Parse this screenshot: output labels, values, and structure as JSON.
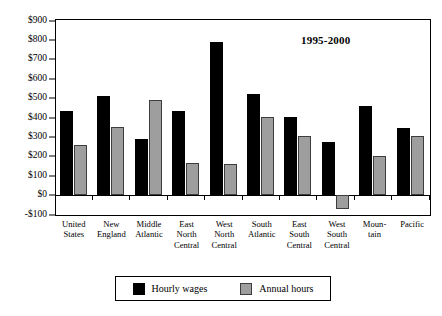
{
  "top_caption": "",
  "annotation": "1995-2000",
  "legend": {
    "entries": [
      {
        "label": "Hourly wages",
        "color": "#000000",
        "key": "wages"
      },
      {
        "label": "Annual hours",
        "color": "#9e9e9e",
        "key": "hours"
      }
    ]
  },
  "axis": {
    "y_ticks": [
      "$900",
      "$800",
      "$700",
      "$600",
      "$500",
      "$400",
      "$300",
      "$200",
      "$100",
      "$0",
      "-$100"
    ],
    "y_tick_values": [
      900,
      800,
      700,
      600,
      500,
      400,
      300,
      200,
      100,
      0,
      -100
    ]
  },
  "categories_wrapped": [
    [
      "United",
      "States"
    ],
    [
      "New",
      "England"
    ],
    [
      "Middle",
      "Atlantic"
    ],
    [
      "East",
      "North",
      "Central"
    ],
    [
      "West",
      "North",
      "Central"
    ],
    [
      "South",
      "Atlantic"
    ],
    [
      "East",
      "South",
      "Central"
    ],
    [
      "West",
      "South",
      "Central"
    ],
    [
      "Moun-",
      "tain"
    ],
    [
      "Pacific"
    ]
  ],
  "chart_data": {
    "type": "bar",
    "title": "",
    "subtitle": "",
    "annotations": [
      "1995-2000"
    ],
    "xlabel": "",
    "ylabel": "",
    "ylim": [
      -100,
      900
    ],
    "ytick_step": 100,
    "ytick_prefix": "$",
    "grid": false,
    "legend_position": "bottom",
    "categories": [
      "United States",
      "New England",
      "Middle Atlantic",
      "East North Central",
      "West North Central",
      "South Atlantic",
      "East South Central",
      "West South Central",
      "Mountain",
      "Pacific"
    ],
    "series": [
      {
        "name": "Hourly wages",
        "color": "#000000",
        "values": [
          430,
          510,
          285,
          430,
          785,
          520,
          400,
          270,
          455,
          345
        ]
      },
      {
        "name": "Annual hours",
        "color": "#9e9e9e",
        "values": [
          255,
          350,
          490,
          165,
          160,
          400,
          300,
          -75,
          200,
          300
        ]
      }
    ]
  }
}
